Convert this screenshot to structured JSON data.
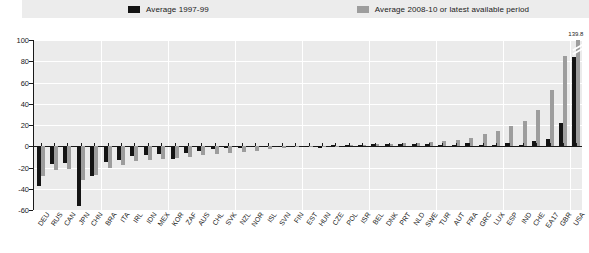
{
  "legend": {
    "items": [
      {
        "label": "Average 1997-99",
        "color": "#141414",
        "name": "legend-average-1997-99"
      },
      {
        "label": "Average 2008-10 or latest available period",
        "color": "#9d9d9d",
        "name": "legend-average-2008-10"
      }
    ]
  },
  "annotation": {
    "usa_value_label": "139.8"
  },
  "chart_data": {
    "type": "bar",
    "title": "",
    "xlabel": "",
    "ylabel": "",
    "ylim": [
      -60,
      100
    ],
    "yticks": [
      100,
      80,
      60,
      40,
      20,
      0,
      -20,
      -40,
      -60
    ],
    "grid": true,
    "legend_position": "top",
    "categories": [
      "DEU",
      "RUS",
      "CAN",
      "JPN",
      "CHN",
      "BRA",
      "ITA",
      "IRL",
      "IDN",
      "MEX",
      "KOR",
      "ZAF",
      "AUS",
      "CHL",
      "SVK",
      "NZL",
      "NOR",
      "ISL",
      "SVN",
      "FIN",
      "EST",
      "HUN",
      "CZE",
      "POL",
      "ISR",
      "BEL",
      "DNK",
      "PRT",
      "NLD",
      "SWE",
      "TUR",
      "AUT",
      "FRA",
      "GRC",
      "LUX",
      "ESP",
      "IND",
      "CHE",
      "EA17",
      "GBR",
      "USA"
    ],
    "series": [
      {
        "name": "Average 1997-99",
        "color": "#141414",
        "values": [
          -37,
          -17,
          -16,
          -56,
          -28,
          -15,
          -13,
          -9,
          -8,
          -7,
          -12,
          -6,
          -4,
          -3,
          -2,
          -2,
          -1,
          -1,
          -1,
          0,
          0,
          -2,
          1,
          1,
          1,
          2,
          2,
          2,
          2,
          2,
          1,
          1,
          3,
          1,
          1,
          3,
          1,
          5,
          7,
          22,
          84
        ]
      },
      {
        "name": "Average 2008-10 or latest available period",
        "color": "#9d9d9d",
        "values": [
          -28,
          -22,
          -21,
          -32,
          -27,
          -20,
          -18,
          -14,
          -13,
          -12,
          -11,
          -10,
          -8,
          -7,
          -6,
          -5,
          -4,
          -3,
          -2,
          -1,
          -1,
          -1,
          0,
          1,
          1,
          2,
          2,
          3,
          3,
          4,
          5,
          6,
          8,
          12,
          14,
          19,
          24,
          34,
          53,
          85,
          139.8
        ]
      }
    ]
  }
}
